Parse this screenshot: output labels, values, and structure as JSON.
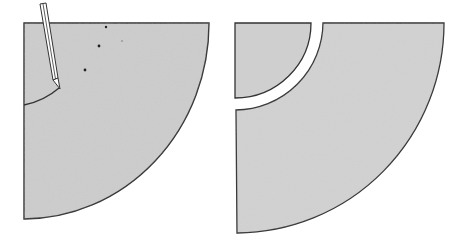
{
  "figure": {
    "colors": {
      "paper": "#c9c9c9",
      "paper_light": "#d4d4d4",
      "outline": "#333333",
      "background": "#ffffff",
      "pencil_body": "#ffffff"
    },
    "panels": [
      {
        "id": "step-1",
        "label": "Quarter-circle sector with pencil marking an inner arc",
        "elements": [
          "quarter-sector",
          "pencil",
          "pencil-arc",
          "dots"
        ]
      },
      {
        "id": "step-2",
        "label": "Sector cut into an inner quarter piece and an outer band",
        "elements": [
          "inner-quarter-piece",
          "outer-band-piece",
          "cut-gap"
        ]
      }
    ]
  }
}
